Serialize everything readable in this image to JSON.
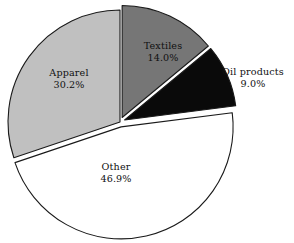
{
  "chart_data": {
    "type": "pie",
    "title": "",
    "subtitle": "",
    "xlabel": "",
    "ylabel": "",
    "legend_position": "none",
    "grid": false,
    "labels_inside": true,
    "start_angle_deg": 0,
    "direction": "clockwise",
    "categories": [
      "Textiles",
      "Oil products",
      "Other",
      "Apparel"
    ],
    "values": [
      14.0,
      9.0,
      46.9,
      30.2
    ],
    "units": "percent",
    "slices": [
      {
        "name": "Textiles",
        "value": 14.0,
        "value_text": "14.0%",
        "color": "#767676",
        "exploded": true,
        "label_placement": "inside"
      },
      {
        "name": "Oil products",
        "value": 9.0,
        "value_text": "9.0%",
        "color": "#0a0a0a",
        "exploded": true,
        "label_placement": "outside"
      },
      {
        "name": "Other",
        "value": 46.9,
        "value_text": "46.9%",
        "color": "#ffffff",
        "exploded": true,
        "label_placement": "inside"
      },
      {
        "name": "Apparel",
        "value": 30.2,
        "value_text": "30.2%",
        "color": "#c0c0c0",
        "exploded": false,
        "label_placement": "inside"
      }
    ],
    "outline_color": "#1a1a1a",
    "background_color": "#ffffff"
  }
}
